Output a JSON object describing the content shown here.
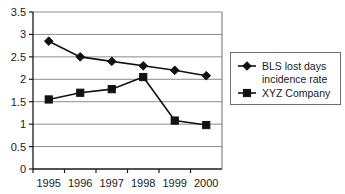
{
  "chart_data": {
    "type": "line",
    "title": "",
    "xlabel": "",
    "ylabel": "",
    "categories": [
      "1995",
      "1996",
      "1997",
      "1998",
      "1999",
      "2000"
    ],
    "x": [
      1995,
      1996,
      1997,
      1998,
      1999,
      2000
    ],
    "ylim": [
      0,
      3.5
    ],
    "xlim": [
      1995,
      2000
    ],
    "grid": "horizontal",
    "legend_position": "right",
    "y_ticks": [
      "0",
      "0.5",
      "1",
      "1.5",
      "2",
      "2.5",
      "3",
      "3.5"
    ],
    "y_tick_values": [
      0,
      0.5,
      1,
      1.5,
      2,
      2.5,
      3,
      3.5
    ],
    "x_ticks": [
      "1995",
      "1996",
      "1997",
      "1998",
      "1999",
      "2000"
    ],
    "series": [
      {
        "name": "BLS lost days incidence rate",
        "marker": "diamond",
        "color": "#111111",
        "values": [
          2.85,
          2.5,
          2.4,
          2.3,
          2.2,
          2.08
        ]
      },
      {
        "name": "XYZ Company",
        "marker": "square",
        "color": "#111111",
        "values": [
          1.55,
          1.7,
          1.78,
          2.05,
          1.08,
          0.98
        ]
      }
    ]
  },
  "legend": {
    "entries": [
      {
        "label_line1": "BLS lost days",
        "label_line2": "incidence rate",
        "marker": "diamond"
      },
      {
        "label_line1": "XYZ Company",
        "label_line2": "",
        "marker": "square"
      }
    ]
  },
  "colors": {
    "series": "#111111",
    "gridline": "#8c8c8c",
    "axis": "#1a1a1a",
    "background": "#ffffff"
  }
}
